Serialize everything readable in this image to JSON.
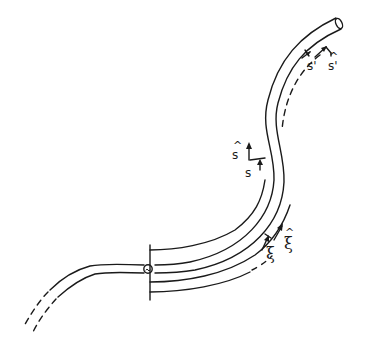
{
  "diagram": {
    "colors": {
      "stroke": "#1a1a1a",
      "background": "#ffffff"
    },
    "labels": {
      "s_prime": "s'",
      "s_hat_prime": "s'",
      "s": "s",
      "s_hat": "s",
      "xi": "ξ",
      "xi_hat": "ξ"
    },
    "elements": [
      "tube-upper-segment",
      "tube-end-cap",
      "dashed-centerline-upper",
      "junction-circle",
      "vertical-boundary-bar",
      "offset-curves-lower",
      "tube-left-dashed-extension"
    ]
  }
}
